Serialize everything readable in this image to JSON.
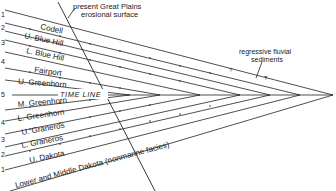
{
  "diagram": {
    "annotations": {
      "erosional_surface": [
        "present Great Plains",
        "erosional surface"
      ],
      "regressive": [
        "regressive fluvial",
        "sediments"
      ],
      "time_line": "TIME LINE",
      "question_mark": "?"
    },
    "upper_numbers": [
      "1",
      "2",
      "3",
      "4",
      "5"
    ],
    "lower_numbers": [
      "4",
      "3",
      "2",
      "1"
    ],
    "units_upper": [
      "Codell",
      "U. Blue Hill",
      "L. Blue Hill",
      "Fairport",
      "U. Greenhorn"
    ],
    "units_lower": [
      "M. Greenhorn",
      "L. Greenhorn",
      "U. Graneros",
      "L. Graneros",
      "U. Dakota",
      "Lower and Middle Dakota (nonmarine facies)"
    ],
    "colors": {
      "line": "#222222",
      "background": "#ffffff"
    }
  }
}
